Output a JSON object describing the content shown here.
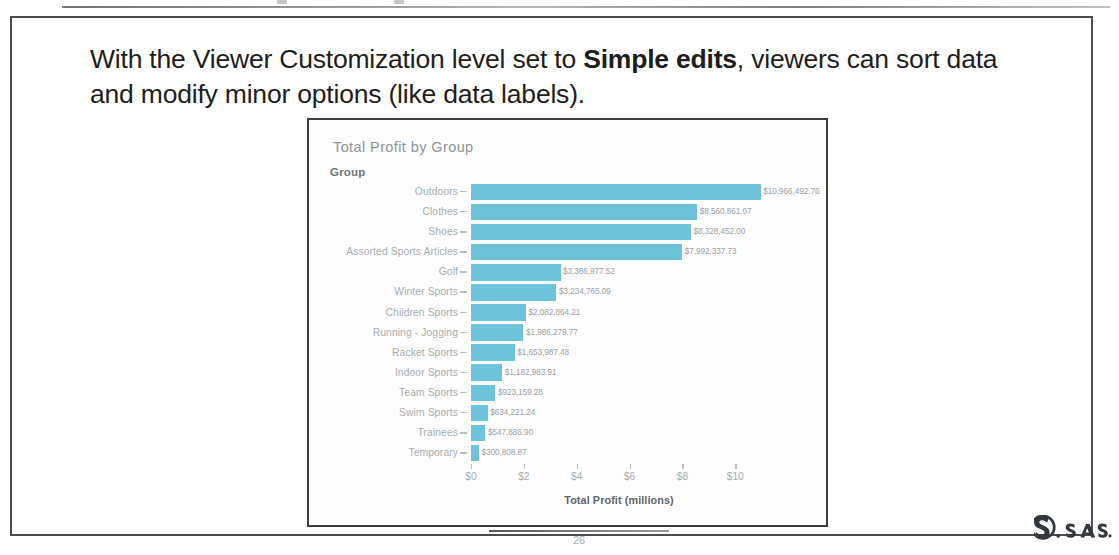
{
  "slide": {
    "headline_part1": "With the Viewer Customization level set to ",
    "headline_bold": "Simple edits",
    "headline_part2": ", viewers can sort data and modify minor options (like data labels).",
    "page_number": "26",
    "brand": "sas"
  },
  "chart_data": {
    "type": "bar",
    "orientation": "horizontal",
    "title": "Total Profit by Group",
    "legend_title": "Group",
    "xlabel": "Total Profit (millions)",
    "ylabel": "",
    "xlim": [
      0,
      11.2
    ],
    "xticks": [
      0,
      2,
      4,
      6,
      8,
      10
    ],
    "xtick_labels": [
      "$0",
      "$2",
      "$4",
      "$6",
      "$8",
      "$10"
    ],
    "grid": false,
    "legend_position": "none",
    "bar_color": "#6cc3da",
    "categories": [
      "Outdoors",
      "Clothes",
      "Shoes",
      "Assorted Sports Articles",
      "Golf",
      "Winter Sports",
      "Children Sports",
      "Running - Jogging",
      "Racket Sports",
      "Indoor Sports",
      "Team Sports",
      "Swim Sports",
      "Trainees",
      "Temporary"
    ],
    "values": [
      10966492.76,
      8560861.07,
      8328452.0,
      7992337.73,
      3386977.52,
      3234765.09,
      2082864.21,
      1986279.77,
      1653987.48,
      1182983.91,
      923159.28,
      634221.24,
      547886.9,
      300808.87
    ],
    "data_labels": [
      "$10,966,492.76",
      "$8,560,861.07",
      "$8,328,452.00",
      "$7,992,337.73",
      "$3,386,977.52",
      "$3,234,765.09",
      "$2,082,864.21",
      "$1,986,279.77",
      "$1,653,987.48",
      "$1,182,983.91",
      "$923,159.28",
      "$634,221.24",
      "$547,886.90",
      "$300,808.87"
    ]
  }
}
